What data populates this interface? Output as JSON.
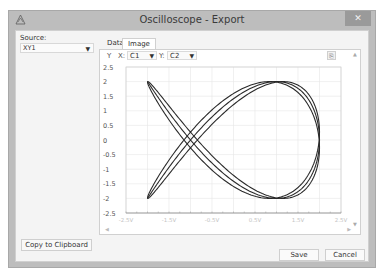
{
  "window": {
    "title": "Oscilloscope - Export",
    "close_label": "✕"
  },
  "left_panel": {
    "source_label": "Source:",
    "source_value": "XY1",
    "copy_button": "Copy to Clipboard"
  },
  "tabs": [
    {
      "label": "Data",
      "active": false
    },
    {
      "label": "Image",
      "active": true
    }
  ],
  "plot_controls": {
    "y_label": "Y",
    "x_label": "X:",
    "x_channel": "C1",
    "y_channel_label": "Y:",
    "y_channel": "C2",
    "export_icon": "export-image-icon"
  },
  "footer": {
    "save": "Save",
    "cancel": "Cancel"
  },
  "colors": {
    "curve": "#2a2a2a",
    "grid": "#e6e6e6",
    "axis": "#9a9a9a"
  },
  "chart_data": {
    "type": "line",
    "subtype": "xy-lissajous",
    "title": "",
    "xlabel": "",
    "ylabel": "Y",
    "xlim": [
      -2.5,
      2.5
    ],
    "ylim": [
      -2.5,
      2.5
    ],
    "x_ticks": [
      "-2.5V",
      "-1.5V",
      "-0.5V",
      "0.5V",
      "1.5V",
      "2.5V"
    ],
    "y_ticks": [
      "2.5",
      "2",
      "1.5",
      "1",
      "0.5",
      "0",
      "-0.5",
      "-1",
      "-1.5",
      "-2",
      "-2.5"
    ],
    "grid": true,
    "legend": "none",
    "series": [
      {
        "name": "XY1 (X=C1, Y=C2)",
        "x_formula": "2*cos(2t)",
        "y_formula": "2*sin(3t)",
        "amplitude_x": 2,
        "amplitude_y": 2,
        "freq_x": 2,
        "freq_y": 3,
        "trace_phase_offsets": [
          0.0,
          0.09
        ],
        "key_points": [
          {
            "x": -2.0,
            "y": 2.0
          },
          {
            "x": -2.0,
            "y": -2.0
          },
          {
            "x": 1.0,
            "y": 2.0
          },
          {
            "x": 1.0,
            "y": -2.0
          },
          {
            "x": 2.0,
            "y": 0.0
          },
          {
            "x": -1.0,
            "y": 0.0
          }
        ]
      }
    ]
  }
}
